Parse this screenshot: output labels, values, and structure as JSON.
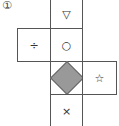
{
  "figure_label": "①",
  "net": {
    "faces": [
      {
        "id": "top",
        "symbol": "▽"
      },
      {
        "id": "left",
        "symbol": "÷"
      },
      {
        "id": "center",
        "symbol": "○"
      },
      {
        "id": "middle",
        "symbol": "diamond-filled",
        "fill": "#999999"
      },
      {
        "id": "right",
        "symbol": "☆"
      },
      {
        "id": "bottom",
        "symbol": "×"
      }
    ]
  }
}
